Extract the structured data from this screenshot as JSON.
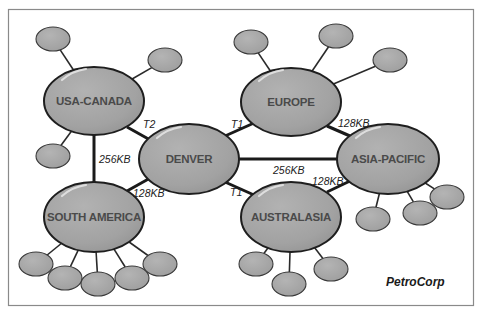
{
  "diagram": {
    "type": "network-topology",
    "brand": "PetroCorp",
    "colors": {
      "hub_fill": "#a3a3a3",
      "satellite_fill": "#a8a8a8",
      "outline": "#1e1e1e",
      "hub_text": "#4a4a4a",
      "frame": "#8a8a8a",
      "background": "#ffffff"
    },
    "hubs": [
      {
        "id": "usa-canada",
        "label": "USA-CANADA",
        "cx": 94,
        "cy": 101,
        "rx": 50,
        "ry": 34
      },
      {
        "id": "denver",
        "label": "DENVER",
        "cx": 189,
        "cy": 159,
        "rx": 50,
        "ry": 35
      },
      {
        "id": "europe",
        "label": "EUROPE",
        "cx": 291,
        "cy": 102,
        "rx": 50,
        "ry": 34
      },
      {
        "id": "asia-pacific",
        "label": "ASIA-PACIFIC",
        "cx": 388,
        "cy": 159,
        "rx": 51,
        "ry": 35
      },
      {
        "id": "south-america",
        "label": "SOUTH AMERICA",
        "cx": 94,
        "cy": 217,
        "rx": 50,
        "ry": 35
      },
      {
        "id": "australasia",
        "label": "AUSTRALASIA",
        "cx": 291,
        "cy": 217,
        "rx": 50,
        "ry": 35
      }
    ],
    "links": [
      {
        "from": "usa-canada",
        "to": "denver",
        "label": "T2",
        "label_x": 143,
        "label_y": 128
      },
      {
        "from": "denver",
        "to": "europe",
        "label": "T1",
        "label_x": 231,
        "label_y": 128
      },
      {
        "from": "usa-canada",
        "to": "south-america",
        "label": "256KB",
        "label_x": 99,
        "label_y": 162
      },
      {
        "from": "denver",
        "to": "south-america",
        "label": "128KB",
        "label_x": 133,
        "label_y": 196
      },
      {
        "from": "denver",
        "to": "asia-pacific",
        "label": "256KB",
        "label_x": 273,
        "label_y": 174
      },
      {
        "from": "denver",
        "to": "australasia",
        "label": "T1",
        "label_x": 229,
        "label_y": 196
      },
      {
        "from": "europe",
        "to": "asia-pacific",
        "label": "128KB",
        "label_x": 338,
        "label_y": 127
      },
      {
        "from": "australasia",
        "to": "asia-pacific",
        "label": "128KB",
        "label_x": 312,
        "label_y": 184
      }
    ],
    "satellites": [
      {
        "hub": "usa-canada",
        "cx": 53,
        "cy": 39,
        "rx": 17,
        "ry": 12
      },
      {
        "hub": "usa-canada",
        "cx": 165,
        "cy": 60,
        "rx": 17,
        "ry": 12
      },
      {
        "hub": "usa-canada",
        "cx": 53,
        "cy": 156,
        "rx": 17,
        "ry": 12
      },
      {
        "hub": "europe",
        "cx": 251,
        "cy": 42,
        "rx": 17,
        "ry": 12
      },
      {
        "hub": "europe",
        "cx": 336,
        "cy": 36,
        "rx": 17,
        "ry": 12
      },
      {
        "hub": "europe",
        "cx": 390,
        "cy": 60,
        "rx": 17,
        "ry": 12
      },
      {
        "hub": "asia-pacific",
        "cx": 373,
        "cy": 219,
        "rx": 17,
        "ry": 12
      },
      {
        "hub": "asia-pacific",
        "cx": 420,
        "cy": 213,
        "rx": 17,
        "ry": 12
      },
      {
        "hub": "asia-pacific",
        "cx": 447,
        "cy": 197,
        "rx": 17,
        "ry": 12
      },
      {
        "hub": "australasia",
        "cx": 256,
        "cy": 264,
        "rx": 17,
        "ry": 12
      },
      {
        "hub": "australasia",
        "cx": 289,
        "cy": 284,
        "rx": 17,
        "ry": 12
      },
      {
        "hub": "australasia",
        "cx": 331,
        "cy": 269,
        "rx": 17,
        "ry": 12
      },
      {
        "hub": "south-america",
        "cx": 36,
        "cy": 264,
        "rx": 17,
        "ry": 12
      },
      {
        "hub": "south-america",
        "cx": 65,
        "cy": 278,
        "rx": 17,
        "ry": 12
      },
      {
        "hub": "south-america",
        "cx": 98,
        "cy": 284,
        "rx": 17,
        "ry": 12
      },
      {
        "hub": "south-america",
        "cx": 132,
        "cy": 278,
        "rx": 17,
        "ry": 12
      },
      {
        "hub": "south-america",
        "cx": 160,
        "cy": 264,
        "rx": 17,
        "ry": 12
      }
    ]
  },
  "labels": {
    "hub_usa_canada": "USA-CANADA",
    "hub_denver": "DENVER",
    "hub_europe": "EUROPE",
    "hub_asia_pacific": "ASIA-PACIFIC",
    "hub_south_america": "SOUTH AMERICA",
    "hub_australasia": "AUSTRALASIA",
    "link_usa_denver": "T2",
    "link_denver_europe": "T1",
    "link_usa_southamerica": "256KB",
    "link_denver_southamerica": "128KB",
    "link_denver_asiapacific": "256KB",
    "link_denver_australasia": "T1",
    "link_europe_asiapacific": "128KB",
    "link_australasia_asiapacific": "128KB",
    "brand": "PetroCorp"
  }
}
